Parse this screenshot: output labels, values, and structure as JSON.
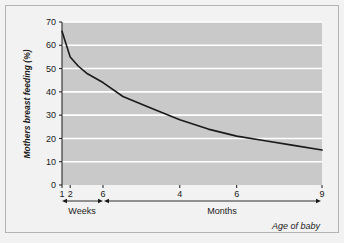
{
  "figure": {
    "background_color": "#f2f2f2",
    "frame_color": "#b4b4b4",
    "plot_background_color": "#c9c9c9",
    "gridline_color": "#ffffff",
    "line_color": "#1a1a1a",
    "axis_color": "#1a1a1a"
  },
  "chart_data": {
    "type": "line",
    "title": "",
    "subtitle": "",
    "xlabel": "Age of baby",
    "ylabel": "Mothers breast feeding (%)",
    "ylim": [
      0,
      70
    ],
    "ytick_labels": [
      "0",
      "10",
      "20",
      "30",
      "40",
      "50",
      "60",
      "70"
    ],
    "ytick_values": [
      0,
      10,
      20,
      30,
      40,
      50,
      60,
      70
    ],
    "grid": true,
    "grid_orientation": "horizontal",
    "legend": false,
    "legend_position": "none",
    "x_axis_type": "piecewise-category",
    "x_segments": [
      {
        "name": "Weeks",
        "label": "Weeks",
        "tick_labels": [
          "1",
          "2",
          "6"
        ],
        "tick_values": [
          1,
          2,
          6
        ]
      },
      {
        "name": "Months",
        "label": "Months",
        "tick_labels": [
          "4",
          "6",
          "9"
        ],
        "tick_values": [
          4,
          6,
          9
        ]
      }
    ],
    "series": [
      {
        "name": "Mothers breast feeding",
        "points": [
          {
            "x_label": "1 week",
            "unit": "weeks",
            "x": 1,
            "y": 66
          },
          {
            "x_label": "2 weeks",
            "unit": "weeks",
            "x": 2,
            "y": 55
          },
          {
            "x_label": "3 weeks",
            "unit": "weeks",
            "x": 3,
            "y": 51
          },
          {
            "x_label": "4 weeks",
            "unit": "weeks",
            "x": 4,
            "y": 48
          },
          {
            "x_label": "6 weeks",
            "unit": "weeks",
            "x": 6,
            "y": 44
          },
          {
            "x_label": "2 months",
            "unit": "months",
            "x": 2,
            "y": 38
          },
          {
            "x_label": "3 months",
            "unit": "months",
            "x": 3,
            "y": 33
          },
          {
            "x_label": "4 months",
            "unit": "months",
            "x": 4,
            "y": 28
          },
          {
            "x_label": "5 months",
            "unit": "months",
            "x": 5,
            "y": 24
          },
          {
            "x_label": "6 months",
            "unit": "months",
            "x": 6,
            "y": 21
          },
          {
            "x_label": "7 months",
            "unit": "months",
            "x": 7,
            "y": 19
          },
          {
            "x_label": "8 months",
            "unit": "months",
            "x": 8,
            "y": 17
          },
          {
            "x_label": "9 months",
            "unit": "months",
            "x": 9,
            "y": 15
          }
        ]
      }
    ]
  }
}
